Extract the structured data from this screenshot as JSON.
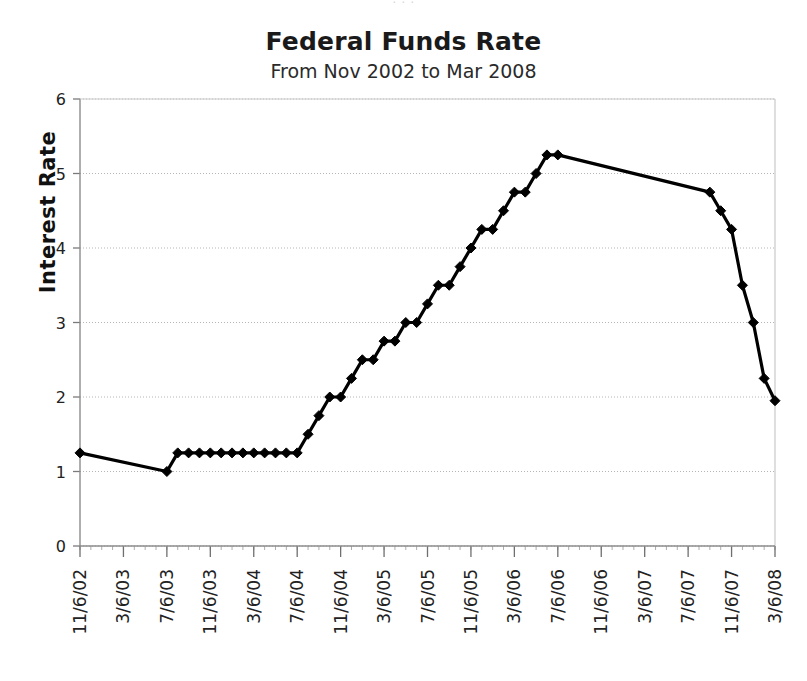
{
  "figure": {
    "top_bleed_text": "· · ·",
    "background_color": "#ffffff"
  },
  "chart_data": {
    "type": "line",
    "title": "Federal Funds Rate",
    "subtitle": "From Nov 2002 to Mar 2008",
    "xlabel": "",
    "ylabel": "Interest Rate",
    "ylim": [
      0,
      6
    ],
    "ytick_labels": [
      "0",
      "1",
      "2",
      "3",
      "4",
      "5",
      "6"
    ],
    "ytick_values": [
      0,
      1,
      2,
      3,
      4,
      5,
      6
    ],
    "grid": true,
    "grid_axis": "y",
    "legend": false,
    "legend_position": "none",
    "marker": "diamond",
    "line_color": "#000000",
    "marker_color": "#000000",
    "xtick_labels": [
      "11/6/02",
      "3/6/03",
      "7/6/03",
      "11/6/03",
      "3/6/04",
      "7/6/04",
      "11/6/04",
      "3/6/05",
      "7/6/05",
      "11/6/05",
      "3/6/06",
      "7/6/06",
      "11/6/06",
      "3/6/07",
      "7/6/07",
      "11/6/07",
      "3/6/08"
    ],
    "xtick_indices": [
      0,
      4,
      8,
      12,
      16,
      20,
      24,
      28,
      32,
      36,
      40,
      44,
      48,
      52,
      56,
      60,
      64
    ],
    "x": [
      "11/6/02",
      "12/6/02",
      "1/6/03",
      "2/6/03",
      "3/6/03",
      "4/6/03",
      "5/6/03",
      "6/6/03",
      "7/6/03",
      "8/6/03",
      "9/6/03",
      "10/6/03",
      "11/6/03",
      "12/6/03",
      "1/6/04",
      "2/6/04",
      "3/6/04",
      "4/6/04",
      "5/6/04",
      "6/6/04",
      "7/6/04",
      "8/6/04",
      "9/6/04",
      "10/6/04",
      "11/6/04",
      "12/6/04",
      "1/6/05",
      "2/6/05",
      "3/6/05",
      "4/6/05",
      "5/6/05",
      "6/6/05",
      "7/6/05",
      "8/6/05",
      "9/6/05",
      "10/6/05",
      "11/6/05",
      "12/6/05",
      "1/6/06",
      "2/6/06",
      "3/6/06",
      "4/6/06",
      "5/6/06",
      "6/6/06",
      "7/6/06",
      "8/6/06",
      "9/6/06",
      "10/6/06",
      "11/6/06",
      "12/6/06",
      "1/6/07",
      "2/6/07",
      "3/6/07",
      "4/6/07",
      "5/6/07",
      "6/6/07",
      "7/6/07",
      "8/6/07",
      "9/6/07",
      "10/6/07",
      "11/6/07",
      "12/6/07",
      "1/6/08",
      "2/6/08",
      "3/6/08"
    ],
    "values": [
      1.25,
      null,
      null,
      null,
      null,
      null,
      null,
      null,
      1.0,
      1.25,
      1.25,
      1.25,
      1.25,
      1.25,
      1.25,
      1.25,
      1.25,
      1.25,
      1.25,
      1.25,
      1.25,
      1.5,
      1.75,
      2.0,
      2.0,
      2.25,
      2.5,
      2.5,
      2.75,
      2.75,
      3.0,
      3.0,
      3.25,
      3.5,
      3.5,
      3.75,
      4.0,
      4.25,
      4.25,
      4.5,
      4.75,
      4.75,
      5.0,
      5.25,
      5.25,
      null,
      null,
      null,
      null,
      null,
      null,
      null,
      null,
      null,
      null,
      null,
      null,
      null,
      4.75,
      4.5,
      4.25,
      3.5,
      3.0,
      2.25,
      1.95
    ],
    "series_note": "Monthly Federal Funds target rate; markers drawn at each observed step."
  }
}
